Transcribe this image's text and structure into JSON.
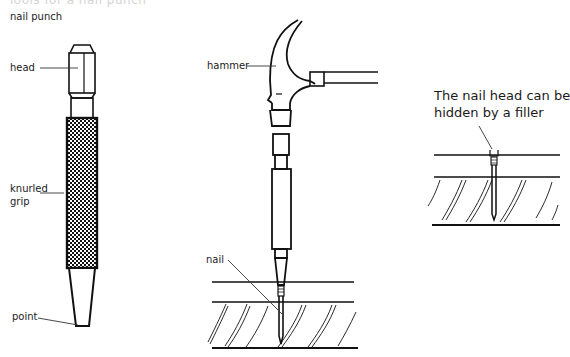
{
  "header": {
    "cut_title": "Tools for a nail punch",
    "section_label": "nail punch"
  },
  "punch": {
    "labels": {
      "head": "head",
      "grip_line1": "knurled",
      "grip_line2": "grip",
      "point": "point"
    }
  },
  "hammering": {
    "labels": {
      "hammer": "hammer",
      "nail": "nail"
    }
  },
  "finished": {
    "note_line1": "The nail head can be",
    "note_line2": "hidden by a filler"
  },
  "colors": {
    "ink": "#111111",
    "background": "#ffffff",
    "label": "#222222"
  }
}
